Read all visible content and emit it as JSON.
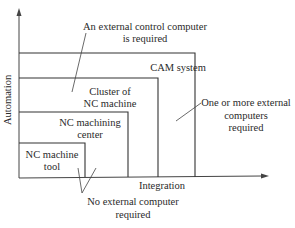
{
  "diagram": {
    "axes": {
      "y_label": "Automation",
      "x_label": "Integration"
    },
    "levels": [
      {
        "id": "nc-machine-tool",
        "label_line1": "NC machine",
        "label_line2": "tool"
      },
      {
        "id": "nc-machining-center",
        "label_line1": "NC machining",
        "label_line2": "center"
      },
      {
        "id": "cluster-nc-machine",
        "label_line1": "Cluster of",
        "label_line2": "NC machine"
      },
      {
        "id": "cam-system",
        "label_line1": "CAM system"
      }
    ],
    "annotations": {
      "external_control": {
        "line1": "An external control computer",
        "line2": "is required"
      },
      "one_or_more": {
        "line1": "One or more external",
        "line2": "computers",
        "line3": "required"
      },
      "no_external": {
        "line1": "No external computer",
        "line2": "required"
      }
    },
    "colors": {
      "line": "#333333",
      "text": "#2a2a2a",
      "background": "#ffffff"
    }
  }
}
